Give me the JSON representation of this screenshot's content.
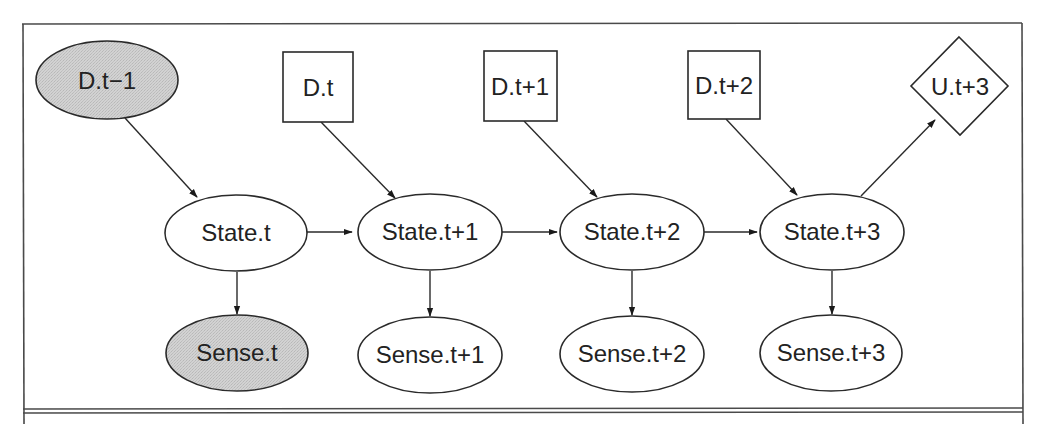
{
  "diagram": {
    "type": "dynamic-decision-network",
    "colors": {
      "observed_fill": "#cfcfcf",
      "node_fill": "#ffffff",
      "stroke": "#2a2a2a",
      "frame": "#4a4a4a"
    },
    "nodes": {
      "d_t_minus_1": {
        "label": "D.t−1",
        "shape": "ellipse",
        "observed": true
      },
      "d_t": {
        "label": "D.t",
        "shape": "rectangle"
      },
      "d_t_plus_1": {
        "label": "D.t+1",
        "shape": "rectangle"
      },
      "d_t_plus_2": {
        "label": "D.t+2",
        "shape": "rectangle"
      },
      "u_t_plus_3": {
        "label": "U.t+3",
        "shape": "diamond"
      },
      "state_t": {
        "label": "State.t",
        "shape": "ellipse"
      },
      "state_t_plus_1": {
        "label": "State.t+1",
        "shape": "ellipse"
      },
      "state_t_plus_2": {
        "label": "State.t+2",
        "shape": "ellipse"
      },
      "state_t_plus_3": {
        "label": "State.t+3",
        "shape": "ellipse"
      },
      "sense_t": {
        "label": "Sense.t",
        "shape": "ellipse",
        "observed": true
      },
      "sense_t_plus_1": {
        "label": "Sense.t+1",
        "shape": "ellipse"
      },
      "sense_t_plus_2": {
        "label": "Sense.t+2",
        "shape": "ellipse"
      },
      "sense_t_plus_3": {
        "label": "Sense.t+3",
        "shape": "ellipse"
      }
    },
    "edges": [
      {
        "from": "D.t−1",
        "to": "State.t"
      },
      {
        "from": "D.t",
        "to": "State.t+1"
      },
      {
        "from": "D.t+1",
        "to": "State.t+2"
      },
      {
        "from": "D.t+2",
        "to": "State.t+3"
      },
      {
        "from": "State.t+3",
        "to": "U.t+3"
      },
      {
        "from": "State.t",
        "to": "State.t+1"
      },
      {
        "from": "State.t+1",
        "to": "State.t+2"
      },
      {
        "from": "State.t+2",
        "to": "State.t+3"
      },
      {
        "from": "State.t",
        "to": "Sense.t"
      },
      {
        "from": "State.t+1",
        "to": "Sense.t+1"
      },
      {
        "from": "State.t+2",
        "to": "Sense.t+2"
      },
      {
        "from": "State.t+3",
        "to": "Sense.t+3"
      }
    ]
  }
}
